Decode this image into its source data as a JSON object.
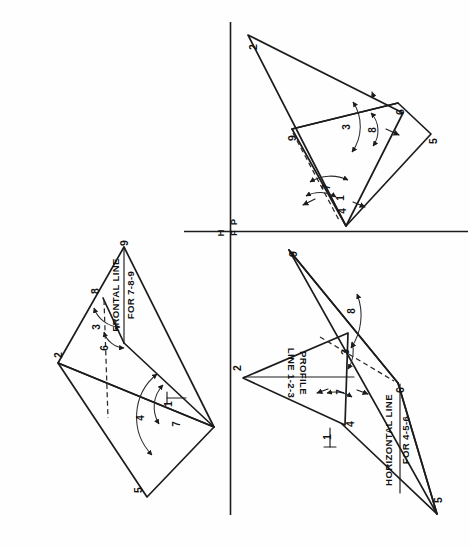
{
  "figure": {
    "domain": "technical-drawing",
    "page_background": "#ffffff",
    "line_color": "#1c1c1c",
    "orientation_note": "Sheet content is rotated 90 degrees on the page."
  },
  "reference_planes": {
    "horizontal_label": "H",
    "frontal_label": "F",
    "profile_label": "P",
    "vertical_fold_line": true,
    "horizontal_fold_line": true
  },
  "views": {
    "top_view": {
      "name": "top-view",
      "vertices": [
        {
          "id": "2",
          "label": "2"
        },
        {
          "id": "9",
          "label": "9"
        },
        {
          "id": "8",
          "label": "8"
        },
        {
          "id": "5",
          "label": "5"
        }
      ],
      "arc_labels": [
        {
          "label": "3"
        },
        {
          "label": "6"
        },
        {
          "label": "1"
        },
        {
          "label": "7"
        },
        {
          "label": "4"
        }
      ],
      "annotation": {
        "line1": "FRONTAL LINE",
        "line2": "FOR 7-8-9"
      }
    },
    "profile_view": {
      "name": "profile-view",
      "vertices": [
        {
          "id": "2",
          "label": "2"
        },
        {
          "id": "9",
          "label": "9"
        },
        {
          "id": "6",
          "label": "6"
        },
        {
          "id": "5",
          "label": "5"
        }
      ],
      "arc_labels": [
        {
          "label": "3"
        },
        {
          "label": "8"
        },
        {
          "label": "7"
        },
        {
          "label": "1"
        },
        {
          "label": "4"
        }
      ]
    },
    "front_view": {
      "name": "front-view",
      "vertices": [
        {
          "id": "2",
          "label": "2"
        },
        {
          "id": "9",
          "label": "9"
        },
        {
          "id": "6",
          "label": "6"
        },
        {
          "id": "4",
          "label": "4"
        },
        {
          "id": "5",
          "label": "5"
        }
      ],
      "arc_labels": [
        {
          "label": "8"
        },
        {
          "label": "3"
        },
        {
          "label": "7"
        },
        {
          "label": "1"
        }
      ],
      "annotations": {
        "profile_line": {
          "line1": "PROFILE",
          "line2": "LINE 1-2-3"
        },
        "horizontal_line": {
          "line1": "HORIZONTAL LINE",
          "line2": "FOR 4-5-6"
        }
      }
    }
  }
}
